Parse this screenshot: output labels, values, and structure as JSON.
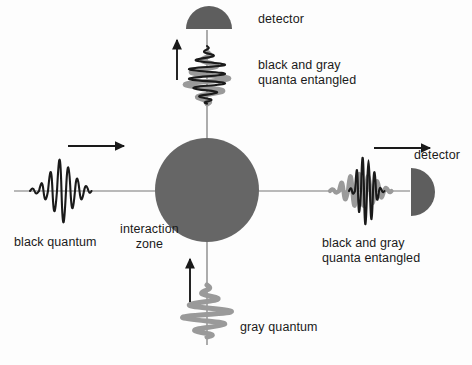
{
  "figure": {
    "background_color": "#fdfdfd"
  },
  "colors": {
    "black_wave": "#1a1a1a",
    "gray_wave": "#9a9a9a",
    "interaction_zone": "#666666",
    "detector": "#5e5e5e",
    "axis": "#777777",
    "arrow": "#1a1a1a",
    "text": "#1a1a1a"
  },
  "labels": {
    "detector_top": "detector",
    "entangled_top": "black and gray\nquanta entangled",
    "detector_right": "detector",
    "entangled_right": "black and gray\nquanta entangled",
    "black_quantum": "black quantum",
    "interaction_zone": "interaction\nzone",
    "gray_quantum": "gray quantum"
  },
  "geometry": {
    "horizontal_axis": {
      "x1": 14,
      "y": 191,
      "x2": 410
    },
    "vertical_axis": {
      "x": 207,
      "y1": 30,
      "y2": 345
    },
    "interaction_zone": {
      "cx": 207,
      "cy": 190,
      "r": 52
    },
    "detector_top": {
      "cx": 209,
      "cy": 27,
      "r": 23
    },
    "detector_right": {
      "cx": 420,
      "cy": 192,
      "r": 24
    }
  },
  "arrows": [
    {
      "name": "incoming-black-quantum-arrow",
      "direction": "right",
      "x1": 68,
      "y1": 146,
      "x2": 126,
      "y2": 146
    },
    {
      "name": "outgoing-entangled-up-arrow",
      "direction": "up",
      "x1": 177,
      "y1": 80,
      "x2": 177,
      "y2": 38
    },
    {
      "name": "incoming-gray-quantum-arrow",
      "direction": "up",
      "x1": 190,
      "y1": 302,
      "x2": 190,
      "y2": 257
    },
    {
      "name": "outgoing-entangled-right-arrow",
      "direction": "right",
      "x1": 374,
      "y1": 148,
      "x2": 432,
      "y2": 148
    }
  ],
  "wave_packets": [
    {
      "name": "black-quantum-packet",
      "orientation": "horizontal",
      "center": [
        62,
        191
      ],
      "colors": [
        "#1a1a1a"
      ],
      "description": "black Gaussian wave packet travelling right toward interaction zone"
    },
    {
      "name": "entangled-packet-top",
      "orientation": "vertical",
      "center": [
        207,
        78
      ],
      "colors": [
        "#9a9a9a",
        "#1a1a1a"
      ],
      "description": "gray and black wave packets superposed, travelling upward to top detector"
    },
    {
      "name": "gray-quantum-packet",
      "orientation": "vertical",
      "center": [
        207,
        312
      ],
      "colors": [
        "#9a9a9a"
      ],
      "description": "gray wave packet travelling upward into interaction zone"
    },
    {
      "name": "entangled-packet-right",
      "orientation": "horizontal",
      "center": [
        360,
        191
      ],
      "colors": [
        "#9a9a9a",
        "#1a1a1a"
      ],
      "description": "gray and black wave packets superposed, travelling right to right detector"
    }
  ]
}
